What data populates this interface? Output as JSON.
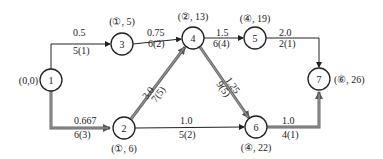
{
  "diagram": {
    "type": "network-shortest-path",
    "nodes": [
      {
        "id": "1",
        "label": "1",
        "tag": "(0,0)",
        "x": 51,
        "y": 80
      },
      {
        "id": "2",
        "label": "2",
        "tag": "(①, 6)",
        "x": 124,
        "y": 128
      },
      {
        "id": "3",
        "label": "3",
        "tag": "(①, 5)",
        "x": 122,
        "y": 44
      },
      {
        "id": "4",
        "label": "4",
        "tag": "(②, 13)",
        "x": 193,
        "y": 38
      },
      {
        "id": "5",
        "label": "5",
        "tag": "(④, 19)",
        "x": 255,
        "y": 38
      },
      {
        "id": "6",
        "label": "6",
        "tag": "(④, 22)",
        "x": 256,
        "y": 127
      },
      {
        "id": "7",
        "label": "7",
        "tag": "(⑥, 26)",
        "x": 319,
        "y": 79
      }
    ],
    "edges": [
      {
        "from": "1",
        "to": "3",
        "top": "0.5",
        "bottom": "5(1)",
        "critical": false
      },
      {
        "from": "3",
        "to": "4",
        "top": "0.75",
        "bottom": "6(2)",
        "critical": false
      },
      {
        "from": "4",
        "to": "5",
        "top": "1.5",
        "bottom": "6(4)",
        "critical": false
      },
      {
        "from": "5",
        "to": "7",
        "top": "2.0",
        "bottom": "2(1)",
        "critical": false
      },
      {
        "from": "1",
        "to": "2",
        "top": "0.667",
        "bottom": "6(3)",
        "critical": true
      },
      {
        "from": "2",
        "to": "4",
        "top": "3.0",
        "bottom": "7(5)",
        "critical": true
      },
      {
        "from": "4",
        "to": "6",
        "top": "1.25",
        "bottom": "9(5)",
        "critical": true
      },
      {
        "from": "2",
        "to": "6",
        "top": "1.0",
        "bottom": "5(2)",
        "critical": false
      },
      {
        "from": "6",
        "to": "7",
        "top": "1.0",
        "bottom": "4(1)",
        "critical": true
      }
    ]
  }
}
